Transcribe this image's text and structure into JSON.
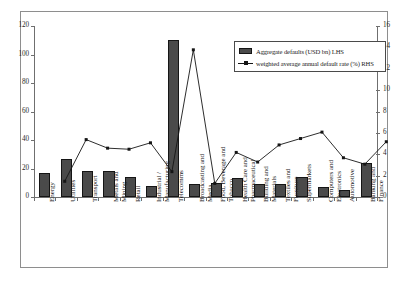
{
  "chart_data": {
    "type": "bar",
    "title": "",
    "subtitle": "",
    "xlabel": "",
    "ylabel": "",
    "categories": [
      "Energy",
      "Utilities",
      "Transport",
      "Metals and Mining",
      "Retail",
      "Industrial / Manufacturing",
      "Telecomms",
      "Broadcasting and Media",
      "Food, Beverage and Tobacco",
      "Health Care and Pharmaceutical",
      "Building and Materials",
      "Textiles and Furniture",
      "Supermarkets",
      "Computers and Electronics",
      "Automotive",
      "Banking and Finance"
    ],
    "series": [
      {
        "name": "Aggregate defaults (USD bn) LHS",
        "type": "bar",
        "axis": "left",
        "color": "#4a4a4a",
        "values": [
          17,
          27,
          18,
          18,
          14,
          8,
          110,
          9,
          10,
          13,
          9,
          9,
          14,
          7,
          5,
          24
        ]
      },
      {
        "name": "weighted average annual default rate (%) RHS",
        "type": "line",
        "axis": "right",
        "color": "#151515",
        "values": [
          2.5,
          6.4,
          5.6,
          5.5,
          6.1,
          3.4,
          14.8,
          2.3,
          5.2,
          4.3,
          5.9,
          6.5,
          7.1,
          4.7,
          4.1,
          6.2
        ]
      }
    ],
    "left_axis": {
      "label": "",
      "min": 0,
      "max": 120,
      "ticks": [
        "0",
        "20",
        "40",
        "60",
        "80",
        "100",
        "120"
      ],
      "tick_values": [
        0,
        20,
        40,
        60,
        80,
        100,
        120
      ]
    },
    "right_axis": {
      "label": "",
      "min": 0,
      "max": 16,
      "ticks": [
        "0",
        "2",
        "4",
        "6",
        "8",
        "10",
        "12",
        "14",
        "16"
      ],
      "tick_values": [
        0,
        2,
        4,
        6,
        8,
        10,
        12,
        14,
        16
      ]
    },
    "grid": false,
    "legend_position": "top-right",
    "legend": [
      "Aggregate defaults (USD bn) LHS",
      "weighted average annual default rate (%) RHS"
    ]
  },
  "legend": {
    "bar_label": "Aggregate defaults (USD bn) LHS",
    "line_label": "weighted average annual default rate (%) RHS"
  }
}
